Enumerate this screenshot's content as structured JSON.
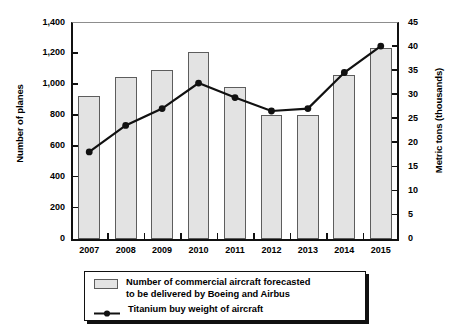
{
  "chart_data": {
    "type": "bar",
    "title": "",
    "subtitle": "",
    "xlabel": "",
    "ylabel": "Number of planes",
    "y2label": "Metric tons (thousands)",
    "categories": [
      "2007",
      "2008",
      "2009",
      "2010",
      "2011",
      "2012",
      "2013",
      "2014",
      "2015"
    ],
    "ylim": [
      0,
      1400
    ],
    "y2lim": [
      0,
      45
    ],
    "yticks": [
      "0",
      "200",
      "400",
      "600",
      "800",
      "1,000",
      "1,200",
      "1,400"
    ],
    "ytick_values": [
      0,
      200,
      400,
      600,
      800,
      1000,
      1200,
      1400
    ],
    "y2ticks": [
      "0",
      "5",
      "10",
      "15",
      "20",
      "25",
      "30",
      "35",
      "40",
      "45"
    ],
    "y2tick_values": [
      0,
      5,
      10,
      15,
      20,
      25,
      30,
      35,
      40,
      45
    ],
    "grid": false,
    "legend_position": "bottom",
    "series": [
      {
        "name": "Number of commercial aircraft forecasted to be delivered by Boeing and Airbus",
        "type": "bar",
        "axis": "left",
        "values": [
          920,
          1045,
          1090,
          1205,
          980,
          800,
          800,
          1060,
          1230
        ]
      },
      {
        "name": "Titanium buy weight of aircraft",
        "type": "line",
        "axis": "right",
        "values": [
          18.0,
          23.5,
          27.0,
          32.3,
          29.3,
          26.5,
          27.0,
          34.5,
          40.0
        ]
      }
    ]
  },
  "legend": {
    "bars_label": "Number of commercial aircraft forecasted\nto be delivered by Boeing and Airbus",
    "line_label": "Titanium buy weight of aircraft"
  },
  "colors": {
    "bar_fill": "#e3e3e3",
    "bar_stroke": "#5d5d5d",
    "line": "#111111",
    "axis": "#111111",
    "background": "#ffffff"
  }
}
